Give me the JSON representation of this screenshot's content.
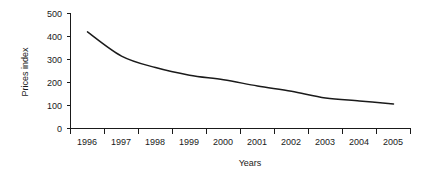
{
  "chart_data": {
    "type": "line",
    "title": "",
    "subtitle": "",
    "xlabel": "Years",
    "ylabel": "Prices index",
    "categories": [
      "1996",
      "1997",
      "1998",
      "1999",
      "2000",
      "2001",
      "2002",
      "2003",
      "2004",
      "2005"
    ],
    "values": [
      420,
      315,
      265,
      232,
      212,
      185,
      162,
      133,
      120,
      107
    ],
    "series": [
      {
        "name": "Prices index",
        "values": [
          420,
          315,
          265,
          232,
          212,
          185,
          162,
          133,
          120,
          107
        ]
      }
    ],
    "ylim": [
      0,
      500
    ],
    "ytick_labels": [
      "0",
      "100",
      "200",
      "300",
      "400",
      "500"
    ],
    "ytick_values": [
      0,
      100,
      200,
      300,
      400,
      500
    ],
    "xtick_labels": [
      "1996",
      "1997",
      "1998",
      "1999",
      "2000",
      "2001",
      "2002",
      "2003",
      "2004",
      "2005"
    ],
    "grid": false,
    "legend": false,
    "legend_position": "none",
    "line_color": "#1a1a1a",
    "axis_color": "#1a1a1a",
    "background_color": "#ffffff",
    "annotations": []
  },
  "axes": {
    "y_title": "Prices index",
    "x_title": "Years"
  },
  "yticks": [
    {
      "label": "500",
      "value": 500
    },
    {
      "label": "400",
      "value": 400
    },
    {
      "label": "300",
      "value": 300
    },
    {
      "label": "200",
      "value": 200
    },
    {
      "label": "100",
      "value": 100
    },
    {
      "label": "0",
      "value": 0
    }
  ],
  "xticks": [
    {
      "label": "1996"
    },
    {
      "label": "1997"
    },
    {
      "label": "1998"
    },
    {
      "label": "1999"
    },
    {
      "label": "2000"
    },
    {
      "label": "2001"
    },
    {
      "label": "2002"
    },
    {
      "label": "2003"
    },
    {
      "label": "2004"
    },
    {
      "label": "2005"
    }
  ]
}
